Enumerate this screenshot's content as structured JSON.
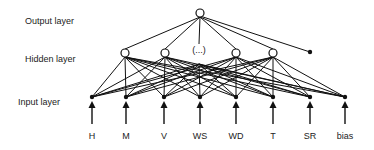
{
  "diagram": {
    "layers": {
      "output": {
        "label": "Output layer"
      },
      "hidden": {
        "label": "Hidden layer",
        "ellipsis": "(...)"
      },
      "input": {
        "label": "Input layer"
      }
    },
    "inputs": [
      {
        "label": "H"
      },
      {
        "label": "M"
      },
      {
        "label": "V"
      },
      {
        "label": "WS"
      },
      {
        "label": "WD"
      },
      {
        "label": "T"
      },
      {
        "label": "SR"
      },
      {
        "label": "bias"
      }
    ],
    "hidden_nodes": 4,
    "hidden_bias": true,
    "output_nodes": 1,
    "colors": {
      "line": "#111111",
      "node_fill": "#ffffff",
      "text": "#222222"
    }
  }
}
